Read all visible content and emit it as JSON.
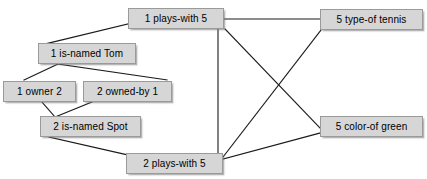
{
  "diagram": {
    "type": "semantic-network-graph",
    "title": "",
    "canvas": {
      "width": 427,
      "height": 179,
      "background": "#ffffff"
    },
    "style": {
      "node_fill": "#d6d6d6",
      "node_border": "#9a9a9a",
      "node_text_color": "#000000",
      "edge_color": "#1a1a1a",
      "edge_width": 1.1,
      "shadow_color": "#787878"
    },
    "nodes": [
      {
        "id": "plays_with_1",
        "label": "1 plays-with 5",
        "x": 128,
        "y": 8,
        "width": 96,
        "height": 21
      },
      {
        "id": "type_of_tennis",
        "label": "5 type-of tennis",
        "x": 320,
        "y": 9,
        "width": 103,
        "height": 21
      },
      {
        "id": "is_named_tom",
        "label": "1 is-named Tom",
        "x": 38,
        "y": 43,
        "width": 98,
        "height": 21
      },
      {
        "id": "owner",
        "label": "1 owner 2",
        "x": 3,
        "y": 81,
        "width": 73,
        "height": 21
      },
      {
        "id": "owned_by",
        "label": "2 owned-by 1",
        "x": 83,
        "y": 81,
        "width": 89,
        "height": 21
      },
      {
        "id": "is_named_spot",
        "label": "2 is-named Spot",
        "x": 40,
        "y": 116,
        "width": 101,
        "height": 21
      },
      {
        "id": "color_of_green",
        "label": "5 color-of green",
        "x": 320,
        "y": 116,
        "width": 103,
        "height": 21
      },
      {
        "id": "plays_with_2",
        "label": "2 plays-with 5",
        "x": 126,
        "y": 153,
        "width": 97,
        "height": 21
      }
    ],
    "edges": [
      {
        "id": "e1",
        "from": "plays_with_1",
        "to": "is_named_tom",
        "x1": 128,
        "y1": 24,
        "x2": 45,
        "y2": 44
      },
      {
        "id": "e2",
        "from": "is_named_tom",
        "to": "owner",
        "x1": 58,
        "y1": 64,
        "x2": 24,
        "y2": 80
      },
      {
        "id": "e3",
        "from": "is_named_tom",
        "to": "owned_by",
        "x1": 58,
        "y1": 64,
        "x2": 167,
        "y2": 80
      },
      {
        "id": "e4",
        "from": "owner",
        "to": "is_named_spot",
        "x1": 42,
        "y1": 102,
        "x2": 55,
        "y2": 117
      },
      {
        "id": "e5",
        "from": "owned_by",
        "to": "is_named_spot",
        "x1": 92,
        "y1": 102,
        "x2": 55,
        "y2": 117
      },
      {
        "id": "e6",
        "from": "is_named_spot",
        "to": "plays_with_2",
        "x1": 49,
        "y1": 137,
        "x2": 128,
        "y2": 155
      },
      {
        "id": "e7",
        "from": "plays_with_1",
        "to": "type_of_tennis",
        "x1": 224,
        "y1": 19,
        "x2": 320,
        "y2": 19
      },
      {
        "id": "e8",
        "from": "plays_with_1",
        "to": "plays_with_2",
        "x1": 218,
        "y1": 29,
        "x2": 218,
        "y2": 153
      },
      {
        "id": "e9",
        "from": "plays_with_1",
        "to": "color_of_green",
        "x1": 225,
        "y1": 29,
        "x2": 320,
        "y2": 128
      },
      {
        "id": "e10",
        "from": "plays_with_2",
        "to": "type_of_tennis",
        "x1": 223,
        "y1": 157,
        "x2": 321,
        "y2": 30
      },
      {
        "id": "e11",
        "from": "plays_with_2",
        "to": "color_of_green",
        "x1": 223,
        "y1": 159,
        "x2": 320,
        "y2": 133
      }
    ]
  }
}
